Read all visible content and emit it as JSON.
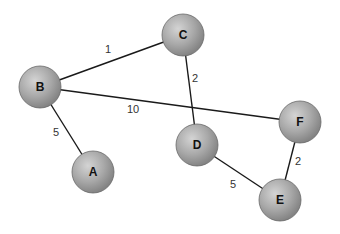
{
  "diagram": {
    "type": "weighted-undirected-graph",
    "node_radius": 21,
    "colors": {
      "background": "#ffffff",
      "edge": "#1a1a1a",
      "node_highlight": "#d4d4d4",
      "node_mid": "#a8a8a8",
      "node_shadow": "#7e7e7e",
      "node_outline": "#6a6a6a",
      "label": "#111111",
      "weight_label": "#333333"
    },
    "nodes": [
      {
        "id": "A",
        "label": "A",
        "x": 93,
        "y": 172
      },
      {
        "id": "B",
        "label": "B",
        "x": 40,
        "y": 87
      },
      {
        "id": "C",
        "label": "C",
        "x": 183,
        "y": 35
      },
      {
        "id": "D",
        "label": "D",
        "x": 197,
        "y": 145
      },
      {
        "id": "E",
        "label": "E",
        "x": 280,
        "y": 200
      },
      {
        "id": "F",
        "label": "F",
        "x": 300,
        "y": 122
      }
    ],
    "edges": [
      {
        "from": "B",
        "to": "C",
        "weight": "1",
        "label_x": 105,
        "label_y": 53
      },
      {
        "from": "B",
        "to": "F",
        "weight": "10",
        "label_x": 127,
        "label_y": 113
      },
      {
        "from": "B",
        "to": "A",
        "weight": "5",
        "label_x": 53,
        "label_y": 136
      },
      {
        "from": "C",
        "to": "D",
        "weight": "2",
        "label_x": 192,
        "label_y": 82
      },
      {
        "from": "D",
        "to": "E",
        "weight": "5",
        "label_x": 230,
        "label_y": 188
      },
      {
        "from": "F",
        "to": "E",
        "weight": "2",
        "label_x": 295,
        "label_y": 165
      }
    ]
  }
}
